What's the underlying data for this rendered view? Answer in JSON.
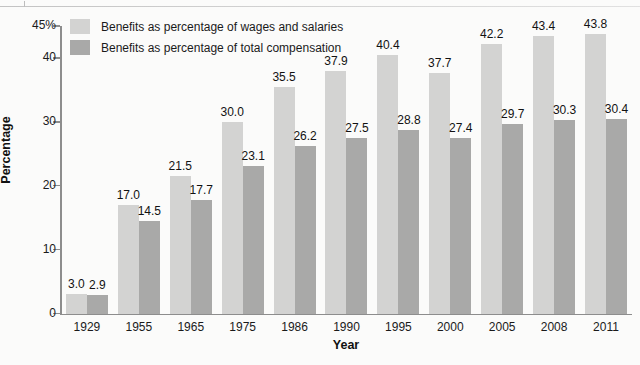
{
  "chart_data": {
    "type": "bar",
    "title": "",
    "xlabel": "Year",
    "ylabel": "Percentage",
    "ylim": [
      0,
      45
    ],
    "yticks": [
      0,
      10,
      20,
      30,
      40,
      45
    ],
    "ytick_labels": [
      "0",
      "10",
      "20",
      "30",
      "40",
      "45%"
    ],
    "grid": false,
    "legend_position": "top-left",
    "categories": [
      "1929",
      "1955",
      "1965",
      "1975",
      "1986",
      "1990",
      "1995",
      "2000",
      "2005",
      "2008",
      "2011"
    ],
    "series": [
      {
        "name": "Benefits as percentage of wages and salaries",
        "color": "#d3d3d2",
        "values": [
          3.0,
          17.0,
          21.5,
          30.0,
          35.5,
          37.9,
          40.4,
          37.7,
          42.2,
          43.4,
          43.8
        ],
        "labels": [
          "3.0",
          "17.0",
          "21.5",
          "30.0",
          "35.5",
          "37.9",
          "40.4",
          "37.7",
          "42.2",
          "43.4",
          "43.8"
        ]
      },
      {
        "name": "Benefits as percentage of total compensation",
        "color": "#a9a9a8",
        "values": [
          2.9,
          14.5,
          17.7,
          23.1,
          26.2,
          27.5,
          28.8,
          27.4,
          29.7,
          30.3,
          30.4
        ],
        "labels": [
          "2.9",
          "14.5",
          "17.7",
          "23.1",
          "26.2",
          "27.5",
          "28.8",
          "27.4",
          "29.7",
          "30.3",
          "30.4"
        ]
      }
    ]
  },
  "legend": {
    "items": [
      {
        "label": "Benefits as percentage of wages and salaries",
        "color": "#d3d3d2"
      },
      {
        "label": "Benefits as percentage of total compensation",
        "color": "#a9a9a8"
      }
    ]
  },
  "axes": {
    "y_title": "Percentage",
    "x_title": "Year"
  },
  "colors": {
    "series1": "#d3d3d2",
    "series2": "#a9a9a8",
    "axis": "#8d8d8d",
    "text": "#1a1a1a",
    "background": "#fbfbfa"
  }
}
